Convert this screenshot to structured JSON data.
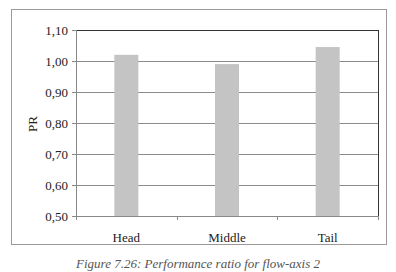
{
  "chart_data": {
    "type": "bar",
    "title": "",
    "xlabel": "",
    "ylabel": "PR",
    "categories": [
      "Head",
      "Middle",
      "Tail"
    ],
    "values": [
      1.02,
      0.99,
      1.045
    ],
    "ylim": [
      0.5,
      1.1
    ],
    "yticks": [
      "0,50",
      "0,60",
      "0,70",
      "0,80",
      "0,90",
      "1,00",
      "1,10"
    ],
    "ytick_values": [
      0.5,
      0.6,
      0.7,
      0.8,
      0.9,
      1.0,
      1.1
    ],
    "grid": true,
    "legend": "none",
    "bar_color": "#c4c4c4",
    "grid_color": "#8c8c8c"
  },
  "caption": "Figure 7.26: Performance ratio for flow-axis 2"
}
